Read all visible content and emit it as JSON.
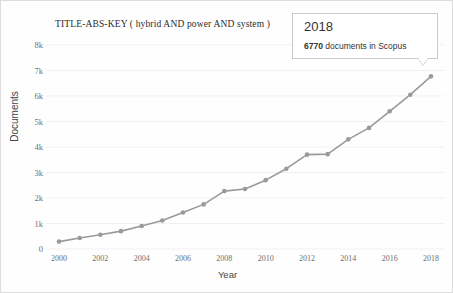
{
  "chart_data": {
    "type": "line",
    "title": "TITLE-ABS-KEY ( hybrid  AND power  AND system )",
    "xlabel": "Year",
    "ylabel": "Documents",
    "xlim": [
      2000,
      2018
    ],
    "ylim": [
      0,
      8000
    ],
    "grid": true,
    "legend": "none",
    "line_color": "#9a9a9a",
    "marker_color": "#9a9a9a",
    "ytick_labels": [
      "8k",
      "7k",
      "6k",
      "5k",
      "4k",
      "3k",
      "2k",
      "1k",
      "0"
    ],
    "ytick_values": [
      8000,
      7000,
      6000,
      5000,
      4000,
      3000,
      2000,
      1000,
      0
    ],
    "xtick_labels": [
      "2000",
      "2002",
      "2004",
      "2006",
      "2008",
      "2010",
      "2012",
      "2014",
      "2016",
      "2018"
    ],
    "xtick_values": [
      2000,
      2002,
      2004,
      2006,
      2008,
      2010,
      2012,
      2014,
      2016,
      2018
    ],
    "x": [
      2000,
      2001,
      2002,
      2003,
      2004,
      2005,
      2006,
      2007,
      2008,
      2009,
      2010,
      2011,
      2012,
      2013,
      2014,
      2015,
      2016,
      2017,
      2018
    ],
    "values": [
      290,
      430,
      560,
      700,
      900,
      1120,
      1430,
      1750,
      2270,
      2350,
      2700,
      3150,
      3700,
      3720,
      4300,
      4750,
      5400,
      6050,
      6770
    ]
  },
  "tooltip": {
    "year": "2018",
    "count": "6770",
    "detail_suffix": " documents in Scopus"
  }
}
